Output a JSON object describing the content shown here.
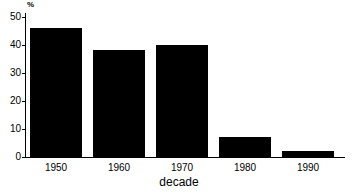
{
  "chart_data": {
    "type": "bar",
    "title": "",
    "subtitle": "",
    "xlabel": "decade",
    "ylabel": "%",
    "categories": [
      "1950",
      "1960",
      "1970",
      "1980",
      "1990"
    ],
    "values": [
      46,
      38,
      40,
      7,
      2
    ],
    "series": [
      {
        "name": "percent",
        "values": [
          46,
          38,
          40,
          7,
          2
        ]
      }
    ],
    "ylim": [
      0,
      50
    ],
    "yticks": [
      0,
      10,
      20,
      30,
      40,
      50
    ],
    "ytick_labels": [
      "0",
      "10",
      "20",
      "30",
      "40",
      "50"
    ],
    "grid": false,
    "legend": false,
    "legend_position": "none",
    "bar_color": "#000000",
    "background_color": "#ffffff",
    "axis_color": "#000000"
  }
}
